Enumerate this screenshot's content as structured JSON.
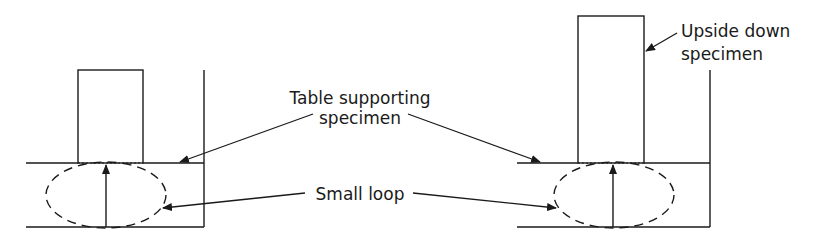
{
  "diagram": {
    "labels": {
      "table_line1": "Table supporting",
      "table_line2": "specimen",
      "small_loop": "Small loop",
      "upside_line1": "Upside down",
      "upside_line2": "specimen"
    },
    "colors": {
      "stroke": "#1a1a1a",
      "background": "#ffffff"
    }
  }
}
